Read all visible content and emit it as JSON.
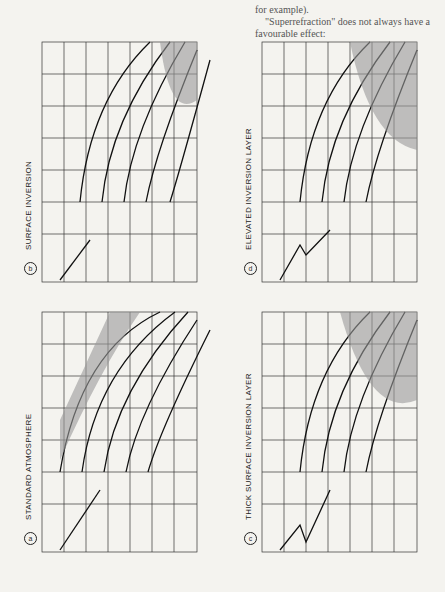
{
  "page": {
    "orientation": "rotated-90",
    "text_fragments": [
      "for example).",
      "\"Superrefraction\" does not always have a favourable effect:"
    ]
  },
  "figure": {
    "panels": [
      {
        "id": "b",
        "title": "SURFACE INVERSION",
        "position": "top-left",
        "annotation": "standard lobe",
        "altitude_ticks": [
          "1000",
          "2000",
          "3000",
          "4000"
        ],
        "altitude_unit": "Feet",
        "altitude_label": "Altitude",
        "m_ticks": [
          "-25",
          "0",
          "25",
          "50"
        ],
        "m_unit": "M",
        "range_ticks": [
          "0",
          "10",
          "20",
          "30",
          "40"
        ],
        "range_label": "Nautical miles"
      },
      {
        "id": "d",
        "title": "ELEVATED INVERSION LAYER",
        "position": "top-right",
        "altitude_ticks": [
          "1000",
          "2000",
          "3000",
          "4000"
        ],
        "altitude_unit": "Feet",
        "altitude_label": "Altitude",
        "m_ticks": [
          "-25",
          "0",
          "25",
          "50"
        ],
        "m_unit": "M",
        "range_ticks": [
          "0",
          "10",
          "20",
          "30",
          "40"
        ],
        "range_label": "Nautical miles"
      },
      {
        "id": "a",
        "title": "STANDARD ATMOSPHERE",
        "position": "bottom-left",
        "annotation": "0.5°",
        "surface_label": "Earth",
        "altitude_ticks": [
          "1000",
          "2000",
          "3000",
          "4000",
          "5000"
        ],
        "altitude_unit": "Feet",
        "altitude_label": "Altitude",
        "m_ticks": [
          "-25",
          "0",
          "25",
          "50"
        ],
        "m_unit": "M",
        "range_ticks": [
          "0",
          "10",
          "20",
          "30",
          "40"
        ],
        "range_label": "Nautical miles"
      },
      {
        "id": "c",
        "title": "THICK SURFACE INVERSION LAYER",
        "position": "bottom-right",
        "altitude_ticks": [
          "1000",
          "2000",
          "3000",
          "4000"
        ],
        "altitude_unit": "Feet",
        "altitude_label": "Altitude",
        "m_ticks": [
          "-25",
          "0",
          "25",
          "50"
        ],
        "m_unit": "M",
        "range_ticks": [
          "0",
          "10",
          "20",
          "30",
          "40"
        ],
        "range_label": "Nautical miles"
      }
    ]
  }
}
